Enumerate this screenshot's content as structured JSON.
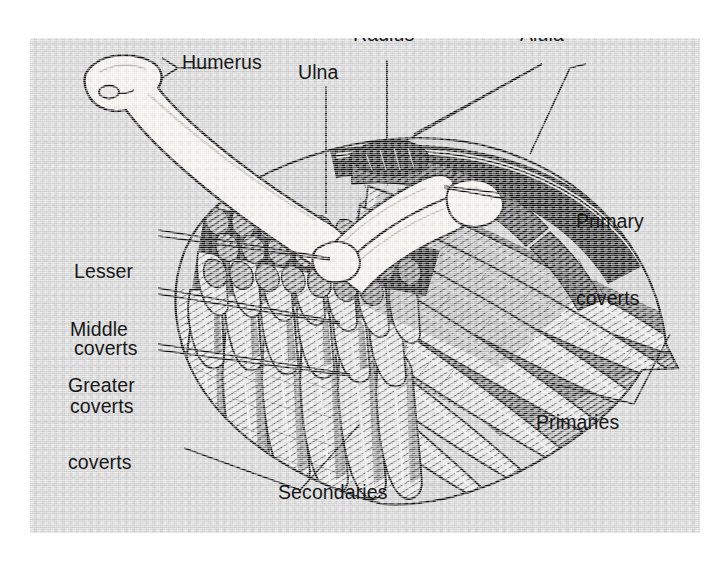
{
  "figure": {
    "view": "dorsal upper wing, spread",
    "style": "black-and-white halftone scientific illustration on gray plate",
    "background_color": "#d5d5d5",
    "ink_color": "#17181a",
    "bone_color": "#f6f4ef",
    "page_color": "#ffffff"
  },
  "labels": {
    "humerus": "Humerus",
    "radius": "Radius",
    "ulna": "Ulna",
    "alula": "Alula",
    "primary_coverts_line1": "Primary",
    "primary_coverts_line2": "coverts",
    "lesser_coverts_line1": "Lesser",
    "lesser_coverts_line2": "coverts",
    "middle_coverts_line1": "Middle",
    "middle_coverts_line2": "coverts",
    "greater_coverts_line1": "Greater",
    "greater_coverts_line2": "coverts",
    "primaries": "Primaries",
    "secondaries": "Secondaries"
  },
  "parts": [
    {
      "id": "humerus",
      "label": "Humerus",
      "group": "bone",
      "leader": "straight-with-tick"
    },
    {
      "id": "radius",
      "label": "Radius",
      "group": "bone",
      "leader": "vertical"
    },
    {
      "id": "ulna",
      "label": "Ulna",
      "group": "bone",
      "leader": "vertical"
    },
    {
      "id": "alula",
      "label": "Alula",
      "group": "feather",
      "leader": "v-pair"
    },
    {
      "id": "primary-coverts",
      "label": "Primary coverts",
      "group": "feather",
      "leader": "wedge"
    },
    {
      "id": "lesser-coverts",
      "label": "Lesser coverts",
      "group": "feather",
      "leader": "wedge"
    },
    {
      "id": "middle-coverts",
      "label": "Middle coverts",
      "group": "feather",
      "leader": "wedge"
    },
    {
      "id": "greater-coverts",
      "label": "Greater coverts",
      "group": "feather",
      "leader": "wedge"
    },
    {
      "id": "primaries",
      "label": "Primaries",
      "group": "feather",
      "leader": "bracket"
    },
    {
      "id": "secondaries",
      "label": "Secondaries",
      "group": "feather",
      "leader": "bracket"
    }
  ]
}
